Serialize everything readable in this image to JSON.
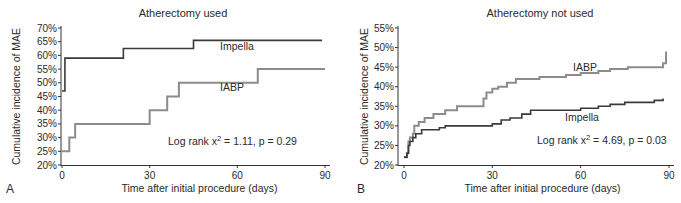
{
  "figure": {
    "panels": [
      {
        "letter": "A",
        "title": "Atherectomy used",
        "xlabel": "Time after initial procedure (days)",
        "ylabel": "Cumulative incidence of MAE",
        "stat_text": "Log rank x",
        "stat_sup": "2",
        "stat_rest": " = 1.11, p = 0.29"
      },
      {
        "letter": "B",
        "title": "Atherectomy not used",
        "xlabel": "Time after initial procedure (days)",
        "ylabel": "Cumulative incidence of MAE",
        "stat_text": "Log rank x",
        "stat_sup": "2",
        "stat_rest": " = 4.69, p = 0.03"
      }
    ]
  },
  "chart_data": [
    {
      "type": "line",
      "subtype": "step",
      "title": "Atherectomy used",
      "panel_label": "A",
      "xlabel": "Time after initial procedure (days)",
      "ylabel": "Cumulative incidence of MAE",
      "xlim": [
        0,
        90
      ],
      "ylim": [
        20,
        70
      ],
      "xticks": [
        0,
        30,
        60,
        90
      ],
      "yticks": [
        "20%",
        "25%",
        "30%",
        "35%",
        "40%",
        "45%",
        "50%",
        "55%",
        "60%",
        "65%",
        "70%"
      ],
      "grid": false,
      "legend": "inline labels",
      "annotation": "Log rank x2 = 1.11, p = 0.29",
      "series": [
        {
          "name": "Impella",
          "color": "#3a3a3a",
          "x": [
            0,
            1,
            21,
            45,
            89
          ],
          "y": [
            47,
            59,
            62.5,
            65.5,
            65.5
          ]
        },
        {
          "name": "IABP",
          "color": "#8c8c8c",
          "x": [
            0,
            2.5,
            4.5,
            30,
            36,
            40,
            67,
            90
          ],
          "y": [
            25,
            30,
            35,
            40,
            45,
            50,
            55,
            55
          ]
        }
      ]
    },
    {
      "type": "line",
      "subtype": "step",
      "title": "Atherectomy not used",
      "panel_label": "B",
      "xlabel": "Time after initial procedure (days)",
      "ylabel": "Cumulative incidence of MAE",
      "xlim": [
        0,
        90
      ],
      "ylim": [
        20,
        55
      ],
      "xticks": [
        0,
        30,
        60,
        90
      ],
      "yticks": [
        "20%",
        "25%",
        "30%",
        "35%",
        "40%",
        "45%",
        "50%",
        "55%"
      ],
      "grid": false,
      "legend": "inline labels",
      "annotation": "Log rank x2 = 4.69, p = 0.03",
      "series": [
        {
          "name": "IABP",
          "color": "#8c8c8c",
          "x": [
            0,
            1,
            1.5,
            2,
            3,
            3.5,
            5,
            7,
            10,
            14,
            18,
            26,
            27,
            28,
            30,
            32,
            35,
            38,
            40,
            46,
            55,
            60,
            66,
            70,
            76,
            88,
            89
          ],
          "y": [
            22,
            23,
            26,
            27,
            28,
            30,
            31,
            32,
            33,
            34,
            35,
            35,
            37,
            38.5,
            39.5,
            40,
            41,
            42,
            42,
            42.5,
            43,
            43.5,
            44,
            44.5,
            45,
            46,
            49
          ]
        },
        {
          "name": "Impella",
          "color": "#3a3a3a",
          "x": [
            0,
            1,
            1.5,
            2,
            3,
            4,
            6,
            12,
            14,
            30,
            33,
            36,
            40,
            43,
            60,
            66,
            70,
            75,
            85,
            88
          ],
          "y": [
            22,
            23,
            25,
            26,
            27,
            28,
            29,
            29.5,
            30,
            30.5,
            31.5,
            32,
            33,
            34,
            34.5,
            35,
            35.5,
            36,
            36.5,
            37
          ]
        }
      ]
    }
  ]
}
